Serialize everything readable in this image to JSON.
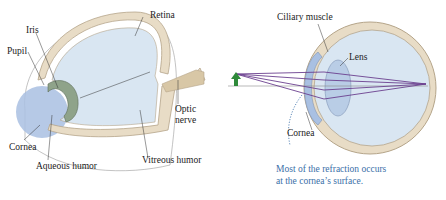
{
  "left_diagram": {
    "title": "Anatomy of the human eye",
    "labels": {
      "retina": "Retina",
      "iris": "Iris",
      "pupil": "Pupil",
      "optic_nerve_1": "Optic",
      "optic_nerve_2": "nerve",
      "cornea": "Cornea",
      "aqueous_humor": "Aqueous humor",
      "vitreous_humor": "Vitreous humor"
    }
  },
  "right_diagram": {
    "title": "Refraction in the eye",
    "labels": {
      "ciliary_muscle": "Ciliary muscle",
      "lens": "Lens",
      "cornea": "Cornea"
    },
    "note_line1": "Most of the refraction occurs",
    "note_line2": "at the cornea’s surface."
  },
  "colors": {
    "vitreous": "#d9e6f2",
    "sclera": "#e8dcc6",
    "sclera_edge": "#b5a58a",
    "cornea": "#a9c0e2",
    "iris": "#8fa38a",
    "rays": "#6b3f8f",
    "object_arrow": "#2f8a3a",
    "note": "#3a6fa8"
  }
}
